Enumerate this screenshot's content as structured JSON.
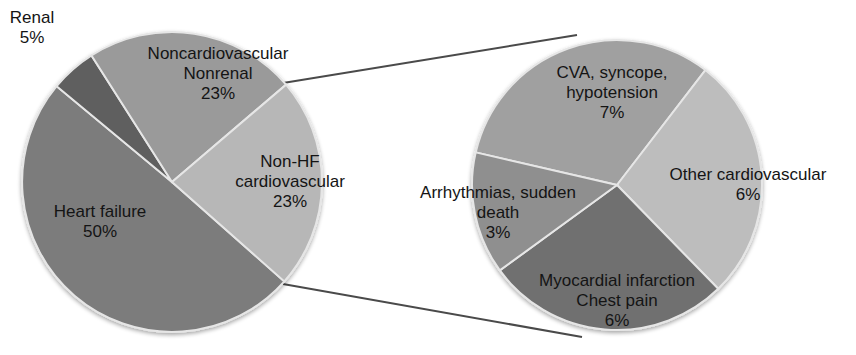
{
  "chart_data": [
    {
      "type": "pie",
      "title": "",
      "name": "main_causes",
      "slices": [
        {
          "label": "Heart failure",
          "lines": [
            "Heart failure",
            "50%"
          ],
          "value": 50,
          "color": "#7b7b7b"
        },
        {
          "label": "Renal",
          "lines": [
            "Renal",
            "5%"
          ],
          "value": 5,
          "color": "#5e5e5e"
        },
        {
          "label": "Noncardiovascular Nonrenal",
          "lines": [
            "Noncardiovascular",
            "Nonrenal",
            "23%"
          ],
          "value": 23,
          "color": "#9a9a9a"
        },
        {
          "label": "Non-HF cardiovascular",
          "lines": [
            "Non-HF",
            "cardiovascular",
            "23%"
          ],
          "value": 23,
          "color": "#b7b7b7"
        }
      ]
    },
    {
      "type": "pie",
      "title": "",
      "name": "non_hf_cardiovascular_breakdown",
      "slices": [
        {
          "label": "CVA, syncope, hypotension",
          "lines": [
            "CVA, syncope,",
            "hypotension",
            "7%"
          ],
          "value": 7,
          "color": "#a0a0a0"
        },
        {
          "label": "Other cardiovascular",
          "lines": [
            "Other cardiovascular",
            "6%"
          ],
          "value": 6,
          "color": "#bdbdbd"
        },
        {
          "label": "Myocardial infarction Chest pain",
          "lines": [
            "Myocardial infarction",
            "Chest pain",
            "6%"
          ],
          "value": 6,
          "color": "#6f6f6f"
        },
        {
          "label": "Arrhythmias, sudden death",
          "lines": [
            "Arrhythmias, sudden",
            "death",
            "3%"
          ],
          "value": 3,
          "color": "#8f8f8f"
        }
      ]
    }
  ],
  "labels": {
    "renal": [
      "Renal",
      "5%"
    ],
    "noncardio": [
      "Noncardiovascular",
      "Nonrenal",
      "23%"
    ],
    "nonhf": [
      "Non-HF",
      "cardiovascular",
      "23%"
    ],
    "hf": [
      "Heart failure",
      "50%"
    ],
    "cva": [
      "CVA, syncope,",
      "hypotension",
      "7%"
    ],
    "other": [
      "Other cardiovascular",
      "6%"
    ],
    "arr": [
      "Arrhythmias, sudden",
      "death",
      "3%"
    ],
    "mi": [
      "Myocardial infarction",
      "Chest pain",
      "6%"
    ]
  }
}
